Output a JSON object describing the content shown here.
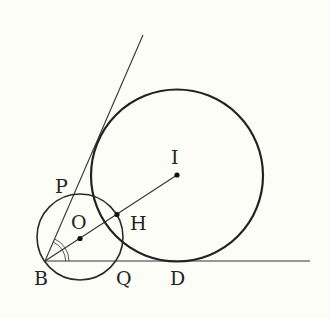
{
  "diagram": {
    "type": "geometry",
    "points": {
      "B": {
        "label": "B"
      },
      "P": {
        "label": "P"
      },
      "O": {
        "label": "O"
      },
      "H": {
        "label": "H"
      },
      "I": {
        "label": "I"
      },
      "Q": {
        "label": "Q"
      },
      "D": {
        "label": "D"
      }
    },
    "circles": [
      {
        "center": "I",
        "tangent_to": [
          "ray-BP",
          "ray-BD"
        ],
        "tangent_point": "D"
      },
      {
        "center": "O",
        "passes_through": [
          "B",
          "P",
          "Q"
        ],
        "intersects_segment_BI_at": "H"
      }
    ],
    "segments": [
      "BI"
    ],
    "rays": [
      "BP",
      "BD"
    ],
    "angle_marks": [
      {
        "vertex": "B",
        "between": [
          "BP",
          "BI"
        ],
        "style": "double-arc"
      },
      {
        "vertex": "B",
        "between": [
          "BI",
          "BD"
        ],
        "style": "double-arc"
      }
    ]
  }
}
